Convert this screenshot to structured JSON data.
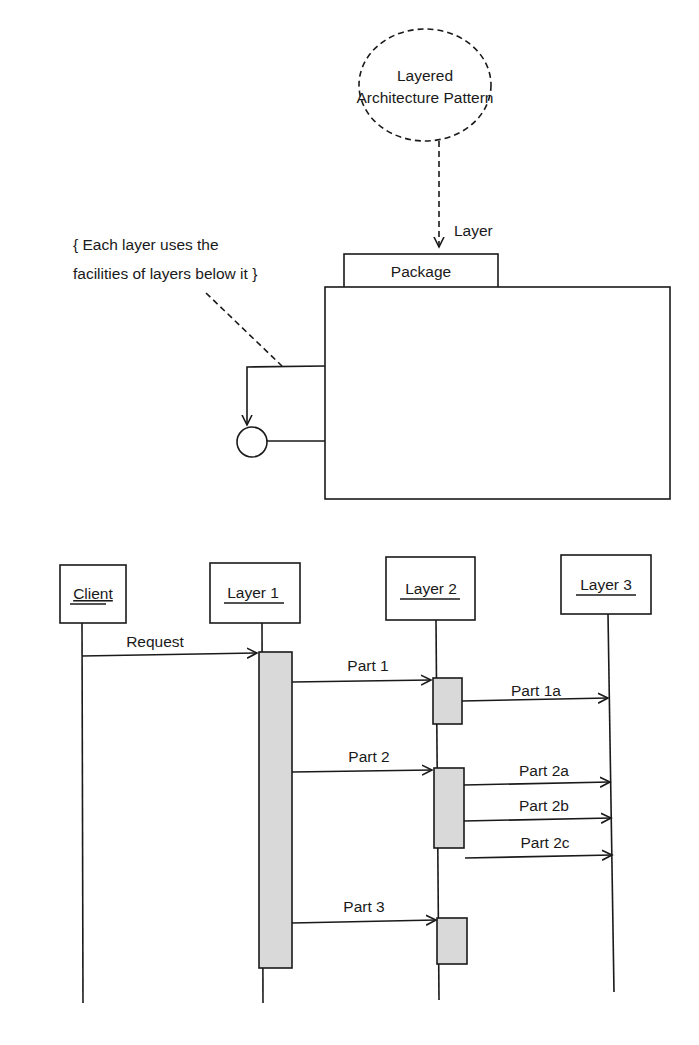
{
  "pattern": {
    "ellipse_label_line1": "Layered",
    "ellipse_label_line2": "Architecture Pattern",
    "arrow_label": "Layer",
    "package_label": "Package",
    "note_line1": "{ Each layer uses the",
    "note_line2": "facilities of layers below it }"
  },
  "sequence": {
    "participants": [
      {
        "label": "Client"
      },
      {
        "label": "Layer 1"
      },
      {
        "label": "Layer 2"
      },
      {
        "label": "Layer 3"
      }
    ],
    "messages": [
      {
        "label": "Request",
        "from": "Client",
        "to": "Layer 1"
      },
      {
        "label": "Part 1",
        "from": "Layer 1",
        "to": "Layer 2"
      },
      {
        "label": "Part 1a",
        "from": "Layer 2",
        "to": "Layer 3"
      },
      {
        "label": "Part 2",
        "from": "Layer 1",
        "to": "Layer 2"
      },
      {
        "label": "Part 2a",
        "from": "Layer 2",
        "to": "Layer 3"
      },
      {
        "label": "Part 2b",
        "from": "Layer 2",
        "to": "Layer 3"
      },
      {
        "label": "Part 2c",
        "from": "Layer 2",
        "to": "Layer 3"
      },
      {
        "label": "Part 3",
        "from": "Layer 1",
        "to": "Layer 2"
      }
    ]
  },
  "colors": {
    "line": "#1a1a1a",
    "activation_fill": "#d9d9d9",
    "background": "#ffffff"
  }
}
